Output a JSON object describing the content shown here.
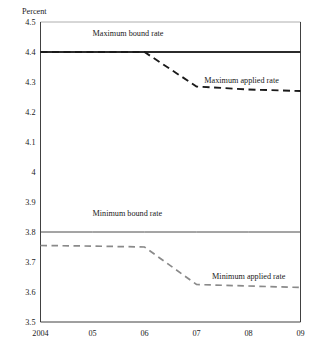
{
  "chart_data": {
    "type": "line",
    "title": "",
    "xlabel": "",
    "ylabel": "Percent",
    "ylim": [
      3.5,
      4.5
    ],
    "xlim": [
      2004,
      2009
    ],
    "grid": false,
    "legend_position": "inline-annotations",
    "x": [
      2004,
      2005,
      2006,
      2007,
      2008,
      2009
    ],
    "ytick_labels": [
      "4.5",
      "4.4",
      "4.3",
      "4.2",
      "4.1",
      "4",
      "3.9",
      "3.8",
      "3.7",
      "3.6",
      "3.5"
    ],
    "ytick_values": [
      4.5,
      4.4,
      4.3,
      4.2,
      4.1,
      4.0,
      3.9,
      3.8,
      3.7,
      3.6,
      3.5
    ],
    "xtick_labels": [
      "2004",
      "05",
      "06",
      "07",
      "08",
      "09"
    ],
    "xtick_values": [
      2004,
      2005,
      2006,
      2007,
      2008,
      2009
    ],
    "series": [
      {
        "name": "Maximum bound rate",
        "style": "solid",
        "color": "#2b2b2b",
        "width": 1.9,
        "values": [
          4.4,
          4.4,
          4.4,
          4.4,
          4.4,
          4.4
        ],
        "label_x": 2005.0,
        "label_y": 4.455
      },
      {
        "name": "Maximum applied rate",
        "style": "dashed",
        "color": "#1a1a1a",
        "width": 1.9,
        "values": [
          4.4,
          4.4,
          4.4,
          4.285,
          4.275,
          4.27
        ],
        "label_x": 2007.15,
        "label_y": 4.296
      },
      {
        "name": "Minimum bound rate",
        "style": "solid",
        "color": "#4a4a4a",
        "width": 1.0,
        "values": [
          3.8,
          3.8,
          3.8,
          3.8,
          3.8,
          3.8
        ],
        "label_x": 2005.0,
        "label_y": 3.855
      },
      {
        "name": "Minimum applied rate",
        "style": "dashed",
        "color": "#8a8a8a",
        "width": 1.7,
        "values": [
          3.755,
          3.753,
          3.75,
          3.625,
          3.62,
          3.615
        ],
        "label_x": 2007.3,
        "label_y": 3.645
      }
    ]
  },
  "axis": {
    "unit_label": "Percent"
  }
}
